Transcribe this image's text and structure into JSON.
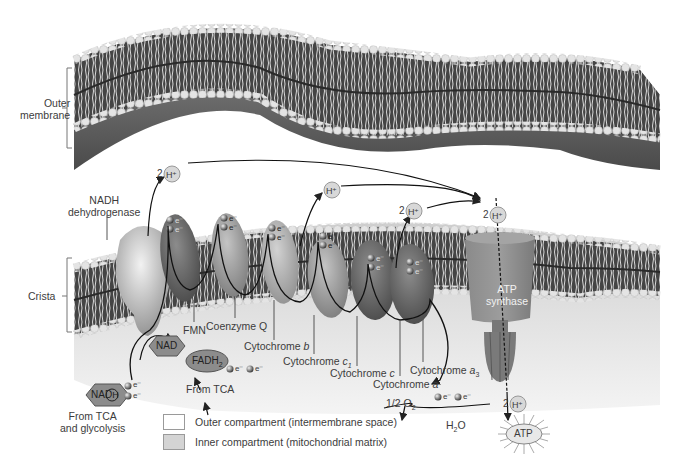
{
  "figure": {
    "colors": {
      "membrane_dark": "#3f3f3f",
      "lipid_head": "#e6e6e6",
      "matrix_fill": "#d9d9d9",
      "complex_light": "#b8b8b8",
      "complex_dark": "#6a6a6a",
      "hexagon": "#8c8c8c",
      "background": "#ffffff"
    }
  },
  "membranes": {
    "outer": {
      "label": "Outer membrane",
      "label_line1": "Outer",
      "label_line2": "membrane"
    },
    "crista": {
      "label": "Crista"
    }
  },
  "complexes": [
    {
      "id": "nadh-dehydrogenase",
      "label_line1": "NADH",
      "label_line2": "dehydrogenase"
    },
    {
      "id": "fmn",
      "label": "FMN"
    },
    {
      "id": "coenzyme-q",
      "label": "Coenzyme Q"
    },
    {
      "id": "cytochrome-b",
      "label": "Cytochrome ",
      "suffix": "b"
    },
    {
      "id": "cytochrome-c1",
      "label": "Cytochrome ",
      "suffix": "c",
      "sub": "1"
    },
    {
      "id": "cytochrome-c",
      "label": "Cytochrome ",
      "suffix": "c"
    },
    {
      "id": "cytochrome-a",
      "label": "Cytochrome ",
      "suffix": "a"
    },
    {
      "id": "cytochrome-a3",
      "label": "Cytochrome ",
      "suffix": "a",
      "sub": "3"
    },
    {
      "id": "atp-synthase",
      "label_line1": "ATP",
      "label_line2": "synthase"
    }
  ],
  "molecules": {
    "nadh": {
      "text": "NAD",
      "circled": "H"
    },
    "nad": {
      "text": "NAD"
    },
    "fadh2": {
      "text": "FADH",
      "sub": "2"
    },
    "electron": "e⁻",
    "proton": "H⁺",
    "proton_2": "2",
    "oxygen": {
      "prefix": "1/2 O",
      "sub": "2"
    },
    "water": {
      "prefix": "H",
      "sub": "2",
      "suffix": "O"
    },
    "atp": "ATP"
  },
  "sources": {
    "tca_glycolysis_line1": "From TCA",
    "tca_glycolysis_line2": "and glycolysis",
    "tca": "From TCA"
  },
  "legend": [
    {
      "label": "Outer compartment (intermembrane space)",
      "color": "#ffffff"
    },
    {
      "label": "Inner compartment (mitochondrial matrix)",
      "color": "#d4d4d4"
    }
  ]
}
